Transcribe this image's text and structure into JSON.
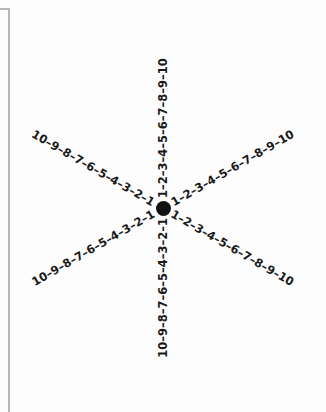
{
  "diagram": {
    "center": {
      "x": 163,
      "y": 208
    },
    "dot_color": "#111111",
    "frame_color": "#b8b8b8",
    "separator": "–",
    "arms": [
      {
        "id": "up",
        "angle_deg": -90,
        "labels": [
          "1",
          "2",
          "3",
          "4",
          "5",
          "6",
          "7",
          "8",
          "9",
          "10"
        ]
      },
      {
        "id": "down",
        "angle_deg": 90,
        "labels": [
          "1",
          "2",
          "3",
          "4",
          "5",
          "6",
          "7",
          "8",
          "9",
          "10"
        ]
      },
      {
        "id": "upper-left",
        "angle_deg": -150,
        "labels": [
          "1",
          "2",
          "3",
          "4",
          "5",
          "6",
          "7",
          "8",
          "9",
          "10"
        ]
      },
      {
        "id": "upper-right",
        "angle_deg": -30,
        "labels": [
          "1",
          "2",
          "3",
          "4",
          "5",
          "6",
          "7",
          "8",
          "9",
          "10"
        ]
      },
      {
        "id": "lower-left",
        "angle_deg": 150,
        "labels": [
          "1",
          "2",
          "3",
          "4",
          "5",
          "6",
          "7",
          "8",
          "9",
          "10"
        ]
      },
      {
        "id": "lower-right",
        "angle_deg": 30,
        "labels": [
          "1",
          "2",
          "3",
          "4",
          "5",
          "6",
          "7",
          "8",
          "9",
          "10"
        ]
      }
    ],
    "arm_text": {
      "up": "1–2–3–4–5–6–7–8–9–10",
      "down": "1–2–3–4–5–6–7–8–9–10",
      "upper-left": "1–2–3–4–5–6–7–8–9–10",
      "upper-right": "1–2–3–4–5–6–7–8–9–10",
      "lower-left": "1–2–3–4–5–6–7–8–9–10",
      "lower-right": "1–2–3–4–5–6–7–8–9–10"
    }
  }
}
